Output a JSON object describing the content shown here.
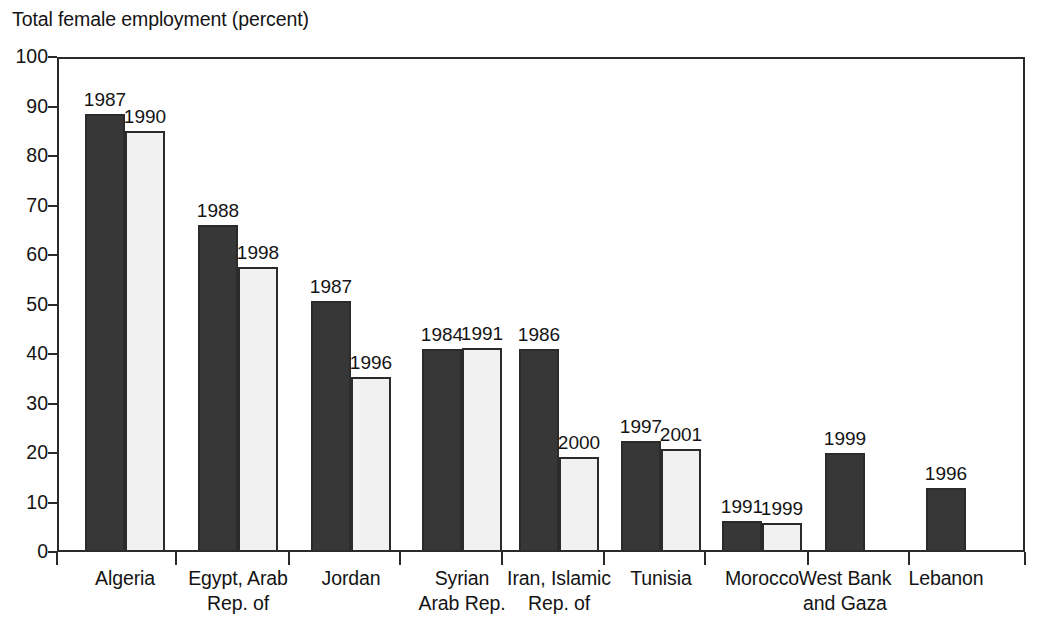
{
  "chart_data": {
    "type": "bar",
    "title": "Total female employment (percent)",
    "xlabel": "",
    "ylabel": "Total female employment (percent)",
    "ylim": [
      0,
      100
    ],
    "y_ticks": [
      0,
      10,
      20,
      30,
      40,
      50,
      60,
      70,
      80,
      90,
      100
    ],
    "grid": false,
    "legend": "none",
    "legend_entries": [],
    "bar_colors": {
      "earlier_year": "#373737",
      "later_year": "#f1f1f1",
      "bar_border": "#2b2b2b",
      "axis": "#2a2a2a",
      "text": "#141414",
      "background": "#ffffff"
    },
    "categories": [
      "Algeria",
      "Egypt, Arab Rep. of",
      "Jordan",
      "Syrian Arab Rep.",
      "Iran, Islamic Rep. of",
      "Tunisia",
      "Morocco",
      "West Bank and Gaza",
      "Lebanon"
    ],
    "category_label_lines": [
      [
        "Algeria"
      ],
      [
        "Egypt, Arab",
        "Rep. of"
      ],
      [
        "Jordan"
      ],
      [
        "Syrian",
        "Arab Rep."
      ],
      [
        "Iran, Islamic",
        "Rep. of"
      ],
      [
        "Tunisia"
      ],
      [
        "Morocco"
      ],
      [
        "West Bank",
        "and Gaza"
      ],
      [
        "Lebanon"
      ]
    ],
    "groups": [
      {
        "category": "Algeria",
        "bars": [
          {
            "year": "1987",
            "value": 88.5,
            "shade": "dark"
          },
          {
            "year": "1990",
            "value": 85.0,
            "shade": "light"
          }
        ]
      },
      {
        "category": "Egypt, Arab Rep. of",
        "bars": [
          {
            "year": "1988",
            "value": 66.0,
            "shade": "dark"
          },
          {
            "year": "1998",
            "value": 57.5,
            "shade": "light"
          }
        ]
      },
      {
        "category": "Jordan",
        "bars": [
          {
            "year": "1987",
            "value": 50.8,
            "shade": "dark"
          },
          {
            "year": "1996",
            "value": 35.3,
            "shade": "light"
          }
        ]
      },
      {
        "category": "Syrian Arab Rep.",
        "bars": [
          {
            "year": "1984",
            "value": 41.0,
            "shade": "dark"
          },
          {
            "year": "1991",
            "value": 41.2,
            "shade": "light"
          }
        ]
      },
      {
        "category": "Iran, Islamic Rep. of",
        "bars": [
          {
            "year": "1986",
            "value": 41.0,
            "shade": "dark"
          },
          {
            "year": "2000",
            "value": 19.2,
            "shade": "light"
          }
        ]
      },
      {
        "category": "Tunisia",
        "bars": [
          {
            "year": "1997",
            "value": 22.5,
            "shade": "dark"
          },
          {
            "year": "2001",
            "value": 20.8,
            "shade": "light"
          }
        ]
      },
      {
        "category": "Morocco",
        "bars": [
          {
            "year": "1991",
            "value": 6.3,
            "shade": "dark"
          },
          {
            "year": "1999",
            "value": 5.8,
            "shade": "light"
          }
        ]
      },
      {
        "category": "West Bank and Gaza",
        "bars": [
          {
            "year": "1999",
            "value": 20.0,
            "shade": "dark"
          }
        ]
      },
      {
        "category": "Lebanon",
        "bars": [
          {
            "year": "1996",
            "value": 13.0,
            "shade": "dark"
          }
        ]
      }
    ]
  },
  "geometry": {
    "plot_left": 57,
    "plot_right": 1025,
    "plot_top": 57,
    "plot_bottom": 552,
    "bar_width": 40,
    "group_starts": [
      85,
      198,
      311,
      422,
      519,
      621,
      722,
      825,
      926
    ],
    "tick_positions": [
      57,
      176,
      289,
      400,
      502,
      604,
      705,
      808,
      909,
      1025
    ]
  }
}
